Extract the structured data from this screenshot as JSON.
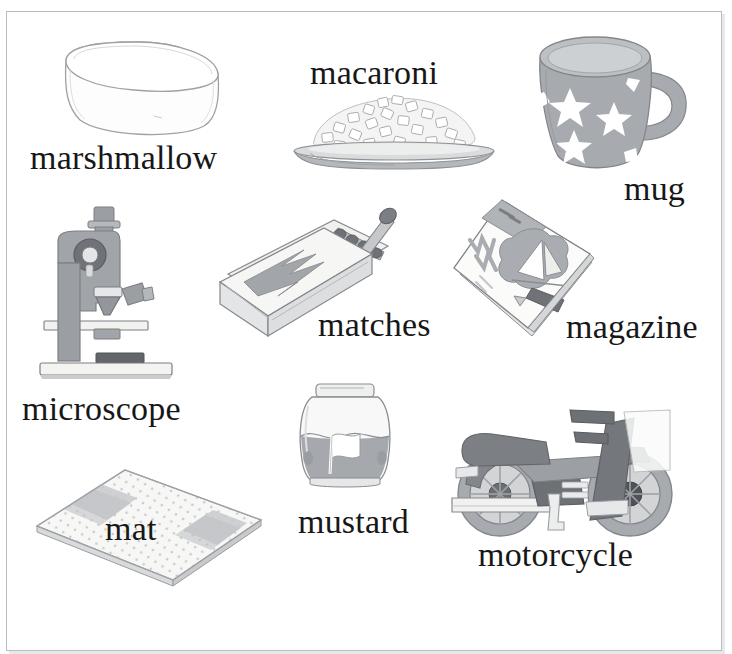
{
  "page": {
    "kind": "picture-dictionary-page",
    "letter": "m",
    "background_color": "#ffffff",
    "frame_color": "#b9bcbe",
    "label_color": "#171717",
    "palette": {
      "outline": "#8d9094",
      "light_gray": "#e9eaec",
      "mid_gray": "#a9acb0",
      "gray": "#9b9ea2",
      "dark_gray": "#6f7377",
      "darkest_gray": "#4e5256",
      "white": "#ffffff",
      "paper": "#f4f4f2"
    }
  },
  "entries": [
    {
      "id": "marshmallow",
      "label": "marshmallow",
      "icon": "marshmallow-illustration",
      "description": "white cylindrical marshmallow drawn in outline",
      "label_x": 30,
      "label_y": 141,
      "label_size": 34,
      "art_x": 58,
      "art_y": 30,
      "art_w": 170,
      "art_h": 110
    },
    {
      "id": "macaroni",
      "label": "macaroni",
      "icon": "macaroni-illustration",
      "description": "heap of macaroni pasta on an oval gray plate",
      "label_x": 310,
      "label_y": 56,
      "label_size": 34,
      "art_x": 288,
      "art_y": 85,
      "art_w": 210,
      "art_h": 85
    },
    {
      "id": "mug",
      "label": "mug",
      "icon": "mug-illustration",
      "description": "gray mug decorated with white stars",
      "label_x": 624,
      "label_y": 172,
      "label_size": 34,
      "art_x": 522,
      "art_y": 30,
      "art_w": 170,
      "art_h": 145
    },
    {
      "id": "microscope",
      "label": "microscope",
      "icon": "microscope-illustration",
      "description": "gray laboratory microscope on a white base",
      "label_x": 22,
      "label_y": 392,
      "label_size": 34,
      "art_x": 38,
      "art_y": 203,
      "art_w": 140,
      "art_h": 185
    },
    {
      "id": "matches",
      "label": "matches",
      "icon": "matchbox-illustration",
      "description": "open matchbox with zigzag label and matches inside",
      "label_x": 318,
      "label_y": 308,
      "label_size": 34,
      "art_x": 212,
      "art_y": 200,
      "art_w": 180,
      "art_h": 155
    },
    {
      "id": "magazine",
      "label": "magazine",
      "icon": "magazine-illustration",
      "description": "magazine tilted on its corner with a sailboat cover",
      "label_x": 566,
      "label_y": 310,
      "label_size": 34,
      "art_x": 446,
      "art_y": 196,
      "art_w": 150,
      "art_h": 150
    },
    {
      "id": "mat",
      "label": "mat",
      "icon": "mat-illustration",
      "description": "speckled rectangular mat with two gray stripes in perspective",
      "label_x": 105,
      "label_y": 512,
      "label_size": 34,
      "art_x": 33,
      "art_y": 462,
      "art_w": 230,
      "art_h": 125
    },
    {
      "id": "mustard",
      "label": "mustard",
      "icon": "mustard-illustration",
      "description": "glass mustard jar with a gray label showing a white flag",
      "label_x": 298,
      "label_y": 505,
      "label_size": 34,
      "art_x": 294,
      "art_y": 382,
      "art_w": 100,
      "art_h": 110
    },
    {
      "id": "motorcycle",
      "label": "motorcycle",
      "icon": "motorcycle-illustration",
      "description": "side view of a gray motorcycle",
      "label_x": 478,
      "label_y": 538,
      "label_size": 34,
      "art_x": 438,
      "art_y": 390,
      "art_w": 235,
      "art_h": 150
    }
  ]
}
